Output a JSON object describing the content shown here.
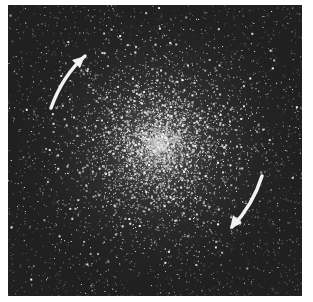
{
  "image": {
    "description": "Grayscale photograph of a dense star cluster with two curved white arrows indicating rotation",
    "background_color": "#ffffff",
    "field_color": "#202020",
    "star_color": "#ffffff",
    "frame": {
      "left": 8,
      "top": 5,
      "width": 294,
      "height": 291
    }
  },
  "cluster": {
    "center": [
      150,
      140
    ],
    "core_radius": 45,
    "halo_radius": 150,
    "star_count": 5200,
    "seed": 1337
  },
  "arrows": [
    {
      "name": "upper-left-arrow",
      "direction": "up-right",
      "color": "#f2f2f2",
      "path": "M 43 103 Q 55 70 77 51",
      "head": "77,51 64,55 72,63"
    },
    {
      "name": "lower-right-arrow",
      "direction": "down-left",
      "color": "#f2f2f2",
      "path": "M 254 171 Q 245 200 224 222",
      "head": "222,224 225,210 234,218"
    }
  ]
}
